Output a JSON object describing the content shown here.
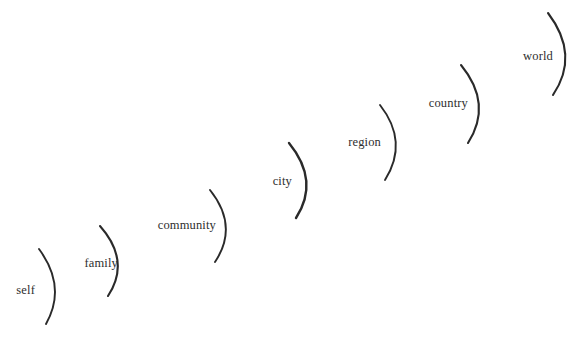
{
  "figure": {
    "type": "concentric-scale-diagram",
    "background_color": "#ffffff",
    "stroke_color": "#2a2a2a",
    "text_color": "#2e2e2e",
    "orientation": "diagonal ascending left-to-right",
    "arc_opening": "left",
    "top_edge_remnant": "",
    "bottom_edge_remnant": ""
  },
  "scales": [
    {
      "label": "self",
      "order": 1,
      "label_x": 35,
      "label_y": 290,
      "arc": {
        "start_x": 39,
        "start_y": 249,
        "ctrl_x": 67,
        "ctrl_y": 287,
        "end_x": 46,
        "end_y": 324,
        "stroke_width": 1.9
      }
    },
    {
      "label": "family",
      "order": 2,
      "label_x": 118,
      "label_y": 263,
      "arc": {
        "start_x": 100,
        "start_y": 226,
        "ctrl_x": 131,
        "ctrl_y": 261,
        "end_x": 108,
        "end_y": 296,
        "stroke_width": 2.1
      }
    },
    {
      "label": "community",
      "order": 3,
      "label_x": 216,
      "label_y": 225,
      "arc": {
        "start_x": 210,
        "start_y": 190,
        "ctrl_x": 239,
        "ctrl_y": 226,
        "end_x": 215,
        "end_y": 262,
        "stroke_width": 1.9
      }
    },
    {
      "label": "city",
      "order": 4,
      "label_x": 292,
      "label_y": 181,
      "arc": {
        "start_x": 289,
        "start_y": 143,
        "ctrl_x": 320,
        "ctrl_y": 181,
        "end_x": 296,
        "end_y": 218,
        "stroke_width": 2.4
      }
    },
    {
      "label": "region",
      "order": 5,
      "label_x": 381,
      "label_y": 142,
      "arc": {
        "start_x": 380,
        "start_y": 105,
        "ctrl_x": 409,
        "ctrl_y": 142,
        "end_x": 385,
        "end_y": 180,
        "stroke_width": 1.9
      }
    },
    {
      "label": "country",
      "order": 6,
      "label_x": 468,
      "label_y": 103,
      "arc": {
        "start_x": 461,
        "start_y": 65,
        "ctrl_x": 493,
        "ctrl_y": 104,
        "end_x": 468,
        "end_y": 143,
        "stroke_width": 2.1
      }
    },
    {
      "label": "world",
      "order": 7,
      "label_x": 553,
      "label_y": 56,
      "arc": {
        "start_x": 548,
        "start_y": 13,
        "ctrl_x": 580,
        "ctrl_y": 55,
        "end_x": 553,
        "end_y": 95,
        "stroke_width": 2.1
      }
    }
  ]
}
